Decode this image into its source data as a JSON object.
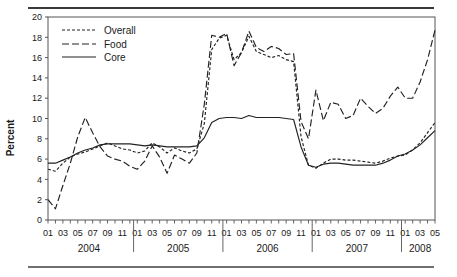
{
  "chart_data": {
    "type": "line",
    "title": "",
    "xlabel": "",
    "ylabel": "Percent",
    "ylim": [
      0,
      20
    ],
    "ytick_step": 2,
    "yticks": [
      "0",
      "2",
      "4",
      "6",
      "8",
      "10",
      "12",
      "14",
      "16",
      "18",
      "20"
    ],
    "grid": false,
    "legend_position": "top-left",
    "years": [
      "2004",
      "2005",
      "2006",
      "2007",
      "2008"
    ],
    "month_tick_labels": [
      "01",
      "03",
      "05",
      "07",
      "09",
      "11"
    ],
    "last_year_month_labels": [
      "01",
      "03",
      "05"
    ],
    "x": [
      "2004-01",
      "2004-02",
      "2004-03",
      "2004-04",
      "2004-05",
      "2004-06",
      "2004-07",
      "2004-08",
      "2004-09",
      "2004-10",
      "2004-11",
      "2004-12",
      "2005-01",
      "2005-02",
      "2005-03",
      "2005-04",
      "2005-05",
      "2005-06",
      "2005-07",
      "2005-08",
      "2005-09",
      "2005-10",
      "2005-11",
      "2005-12",
      "2006-01",
      "2006-02",
      "2006-03",
      "2006-04",
      "2006-05",
      "2006-06",
      "2006-07",
      "2006-08",
      "2006-09",
      "2006-10",
      "2006-11",
      "2006-12",
      "2007-01",
      "2007-02",
      "2007-03",
      "2007-04",
      "2007-05",
      "2007-06",
      "2007-07",
      "2007-08",
      "2007-09",
      "2007-10",
      "2007-11",
      "2007-12",
      "2008-01",
      "2008-02",
      "2008-03",
      "2008-04",
      "2008-05"
    ],
    "series": [
      {
        "name": "Overall",
        "dash": "3,2",
        "values": [
          5.0,
          4.8,
          5.6,
          6.2,
          6.5,
          6.7,
          7.0,
          7.3,
          7.6,
          7.3,
          7.0,
          6.9,
          6.6,
          6.8,
          7.6,
          7.2,
          6.6,
          7.1,
          6.8,
          6.6,
          7.0,
          9.5,
          16.8,
          17.9,
          18.2,
          15.8,
          16.5,
          18.1,
          16.6,
          16.3,
          16.0,
          16.2,
          15.8,
          15.6,
          8.2,
          5.4,
          5.1,
          5.6,
          6.0,
          6.0,
          5.9,
          5.9,
          5.8,
          5.7,
          5.6,
          5.8,
          6.1,
          6.3,
          6.4,
          6.9,
          7.6,
          8.6,
          9.6
        ]
      },
      {
        "name": "Food",
        "dash": "7,3",
        "values": [
          2.0,
          1.1,
          3.4,
          5.6,
          8.2,
          10.1,
          8.6,
          7.2,
          6.3,
          6.0,
          5.8,
          5.3,
          5.0,
          5.8,
          7.3,
          6.2,
          4.6,
          6.4,
          6.0,
          5.6,
          6.6,
          11.4,
          18.2,
          18.0,
          18.4,
          15.2,
          16.5,
          18.6,
          17.0,
          16.6,
          17.1,
          16.9,
          16.3,
          16.4,
          9.7,
          8.0,
          12.8,
          9.8,
          11.6,
          11.4,
          10.0,
          10.3,
          12.0,
          11.2,
          10.5,
          11.0,
          12.2,
          13.1,
          12.0,
          12.0,
          13.6,
          15.8,
          18.7
        ]
      },
      {
        "name": "Core",
        "dash": "",
        "values": [
          5.6,
          5.6,
          5.9,
          6.2,
          6.6,
          6.9,
          7.1,
          7.4,
          7.5,
          7.5,
          7.5,
          7.5,
          7.4,
          7.3,
          7.4,
          7.3,
          7.2,
          7.2,
          7.2,
          7.2,
          7.3,
          8.1,
          9.6,
          10.0,
          10.1,
          10.1,
          10.0,
          10.3,
          10.1,
          10.1,
          10.1,
          10.1,
          10.0,
          9.9,
          7.2,
          5.4,
          5.2,
          5.5,
          5.6,
          5.6,
          5.5,
          5.4,
          5.4,
          5.4,
          5.4,
          5.6,
          5.9,
          6.3,
          6.5,
          6.9,
          7.4,
          8.1,
          8.8
        ]
      }
    ]
  },
  "legend": {
    "items": [
      {
        "label": "Overall"
      },
      {
        "label": "Food"
      },
      {
        "label": "Core"
      }
    ]
  }
}
